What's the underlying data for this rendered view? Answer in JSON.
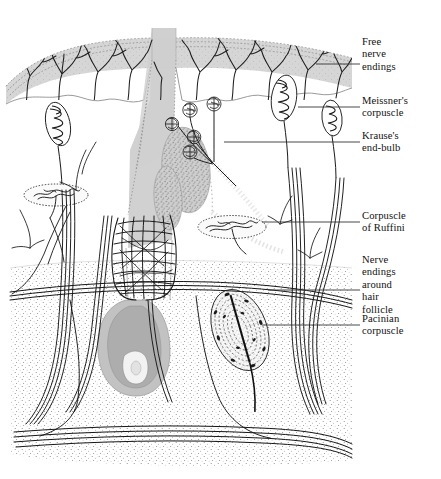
{
  "figure": {
    "type": "anatomical-cross-section-diagram",
    "width": 441,
    "height": 479,
    "background": "#ffffff"
  },
  "palette": {
    "ink": "#1a1a1a",
    "nerve": "#222222",
    "epidermis_fill": "#d2d2d2",
    "epidermis_edge": "#9a9a9a",
    "dermis_fill": "#ffffff",
    "deep_dermis_stipple": "#8a8a8a",
    "hair_shaft": "#c8c8c8",
    "hair_bulb": "#b0b0b0",
    "sebaceous": "#b5b5b5",
    "leader_line": "#333333",
    "label_text": "#111111"
  },
  "labels": [
    {
      "id": "free-nerve-endings",
      "text": "Free\nnerve\nendings",
      "x": 362,
      "y": 36,
      "leader": {
        "x1": 316,
        "y1": 64,
        "x2": 360,
        "y2": 64
      }
    },
    {
      "id": "meissners-corpuscle",
      "text": "Meissner's\ncorpuscle",
      "x": 362,
      "y": 95,
      "leader": {
        "x1": 298,
        "y1": 107,
        "x2": 360,
        "y2": 107
      }
    },
    {
      "id": "krauses-end-bulb",
      "text": "Krause's\nend-bulb",
      "x": 362,
      "y": 130,
      "leader": {
        "x1": 224,
        "y1": 142,
        "x2": 360,
        "y2": 142
      }
    },
    {
      "id": "corpuscle-of-ruffini",
      "text": "Corpuscle\nof Ruffini",
      "x": 362,
      "y": 210,
      "leader": {
        "x1": 262,
        "y1": 222,
        "x2": 360,
        "y2": 222
      }
    },
    {
      "id": "nerve-endings-hair",
      "text": "Nerve\nendings\naround\nhair\nfollicle",
      "x": 362,
      "y": 254,
      "leader": {
        "x1": 268,
        "y1": 290,
        "x2": 360,
        "y2": 290
      }
    },
    {
      "id": "pacinian-corpuscle",
      "text": "Pacinian\ncorpuscle",
      "x": 362,
      "y": 313,
      "leader": {
        "x1": 262,
        "y1": 325,
        "x2": 360,
        "y2": 325
      }
    }
  ],
  "structures": {
    "epidermis": {
      "name": "epidermis",
      "top_y": 30,
      "bottom_y": 95,
      "note": "light grey band with stippled upper margin, wavy lower border"
    },
    "dermis": {
      "name": "dermis",
      "top_y": 95,
      "bottom_y": 262,
      "note": "white papillary / reticular layer"
    },
    "deep_dermis": {
      "name": "deep-dermis",
      "top_y": 262,
      "bottom_y": 462,
      "note": "dense stippled subcutaneous layer"
    },
    "hair_shaft": {
      "name": "hair-shaft",
      "top_x": 152,
      "top_y": 28,
      "width": 24
    },
    "hair_follicle": {
      "name": "hair-follicle",
      "bulb_cx": 120,
      "bulb_cy": 330
    },
    "sebaceous_glands": {
      "name": "sebaceous-glands",
      "count": 2
    },
    "meissner_count": 3,
    "krause_count": 5,
    "ruffini_count": 2,
    "pacinian_count": 1,
    "nerve_trunk_count": 4
  }
}
